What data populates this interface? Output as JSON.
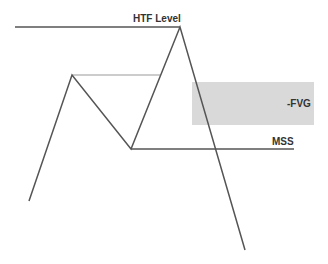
{
  "labels": {
    "htf_level": "HTF Level",
    "fvg": "-FVG",
    "mss": "MSS"
  },
  "colors": {
    "line": "#555555",
    "thin_line": "#888888",
    "fvg_fill": "#d9d9d9",
    "text": "#333333"
  }
}
